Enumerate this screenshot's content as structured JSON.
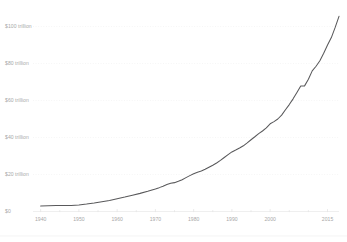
{
  "chart_data": {
    "type": "line",
    "title": "",
    "subtitle": "",
    "xlabel": "",
    "ylabel": "",
    "xlim": [
      1938,
      2018
    ],
    "ylim": [
      0,
      110
    ],
    "grid": true,
    "legend": false,
    "legend_position": "none",
    "units": "trillion US dollars",
    "line_color": "#59595b",
    "grid_color": "#ececec",
    "axis_label_color": "#a8a8a8",
    "y_ticks": [
      0,
      20,
      40,
      60,
      80,
      100
    ],
    "y_tick_labels": [
      "$0",
      "$20 trillion",
      "$40 trillion",
      "$60 trillion",
      "$80 trillion",
      "$100 trillion"
    ],
    "x_ticks": [
      1940,
      1950,
      1960,
      1970,
      1980,
      1990,
      2000,
      2015
    ],
    "x_tick_labels": [
      "1940",
      "1950",
      "1960",
      "1970",
      "1980",
      "1990",
      "2000",
      "2015"
    ],
    "x_minor_ticks": [
      1945,
      1955,
      1965,
      1975,
      1985,
      1995,
      2005,
      2010
    ],
    "series": [
      {
        "name": "Gross world product",
        "color": "#59595b",
        "x": [
          1940,
          1942,
          1944,
          1946,
          1948,
          1950,
          1952,
          1954,
          1956,
          1958,
          1960,
          1962,
          1964,
          1966,
          1968,
          1970,
          1971,
          1972,
          1973,
          1974,
          1975,
          1976,
          1977,
          1978,
          1979,
          1980,
          1981,
          1982,
          1983,
          1984,
          1985,
          1986,
          1987,
          1988,
          1989,
          1990,
          1991,
          1992,
          1993,
          1994,
          1995,
          1996,
          1997,
          1998,
          1999,
          2000,
          2001,
          2002,
          2003,
          2004,
          2005,
          2006,
          2007,
          2008,
          2009,
          2010,
          2011,
          2012,
          2013,
          2014,
          2015,
          2016,
          2017,
          2018
        ],
        "values": [
          3.0,
          3.1,
          3.2,
          3.2,
          3.3,
          3.5,
          4.0,
          4.6,
          5.3,
          6.0,
          6.9,
          7.8,
          8.8,
          9.8,
          10.9,
          12.2,
          12.9,
          13.7,
          14.6,
          15.3,
          15.6,
          16.3,
          17.2,
          18.3,
          19.4,
          20.4,
          21.2,
          21.9,
          22.8,
          23.9,
          25.0,
          26.2,
          27.6,
          29.2,
          30.7,
          32.2,
          33.2,
          34.3,
          35.5,
          37.1,
          38.8,
          40.4,
          42.1,
          43.5,
          45.2,
          47.4,
          48.6,
          50.0,
          52.1,
          55.0,
          57.8,
          60.9,
          64.3,
          67.8,
          67.9,
          71.5,
          76.0,
          78.5,
          81.5,
          85.5,
          90.0,
          94.0,
          99.5,
          105.5
        ]
      }
    ]
  },
  "axis": {
    "y_axis_name": "y-axis",
    "x_axis_name": "x-axis"
  }
}
